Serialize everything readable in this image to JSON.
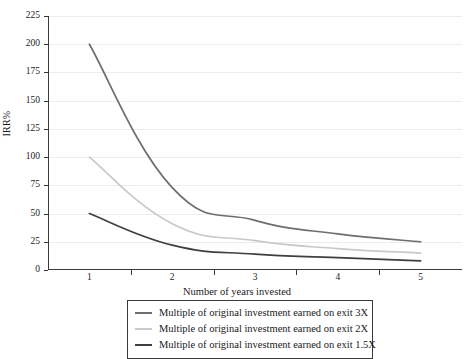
{
  "chart_data": {
    "type": "line",
    "title": "",
    "xlabel": "Number of years invested",
    "ylabel": "IRR%",
    "x": [
      1,
      2,
      3,
      4,
      5
    ],
    "xticklabels": [
      "1",
      "2",
      "3",
      "4",
      "5"
    ],
    "yticklabels": [
      "0",
      "25",
      "50",
      "75",
      "100",
      "125",
      "150",
      "175",
      "200",
      "225"
    ],
    "yticks": [
      0,
      25,
      50,
      75,
      100,
      125,
      150,
      175,
      200,
      225
    ],
    "ylim": [
      0,
      225
    ],
    "xlim": [
      0.5,
      5.5
    ],
    "grid": "horizontal",
    "legend_position": "below-axes",
    "series": [
      {
        "name": "Multiple of original investment earned on exit 3X",
        "color": "#6e6e6e",
        "values": [
          200,
          73,
          44,
          32,
          25
        ]
      },
      {
        "name": "Multiple of original investment earned on exit 2X",
        "color": "#c9c9c9",
        "values": [
          100,
          41,
          26,
          19,
          15
        ]
      },
      {
        "name": "Multiple of original investment earned on exit 1.5X",
        "color": "#3f3f3f",
        "values": [
          50,
          22,
          14,
          11,
          8
        ]
      }
    ]
  },
  "axes": {
    "y_title": "IRR%",
    "x_title": "Number of years invested"
  },
  "legend": {
    "entries": [
      {
        "label": "Multiple of original investment earned on exit 3X",
        "color": "#6e6e6e"
      },
      {
        "label": "Multiple of original investment earned on exit 2X",
        "color": "#c9c9c9"
      },
      {
        "label": "Multiple of original investment earned on exit 1.5X",
        "color": "#3f3f3f"
      }
    ]
  },
  "colors": {
    "axis": "#3a3a3a",
    "grid": "#ececec",
    "background": "#ffffff",
    "text": "#1a1a1a"
  }
}
